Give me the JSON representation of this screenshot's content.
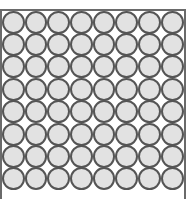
{
  "board": {
    "rows": 8,
    "columns": 8,
    "cell_shape": "circle",
    "colors": {
      "circle_fill": "#e2e2e2",
      "circle_stroke": "#555555",
      "border": "#6a6a6a",
      "background": "#ffffff"
    }
  }
}
